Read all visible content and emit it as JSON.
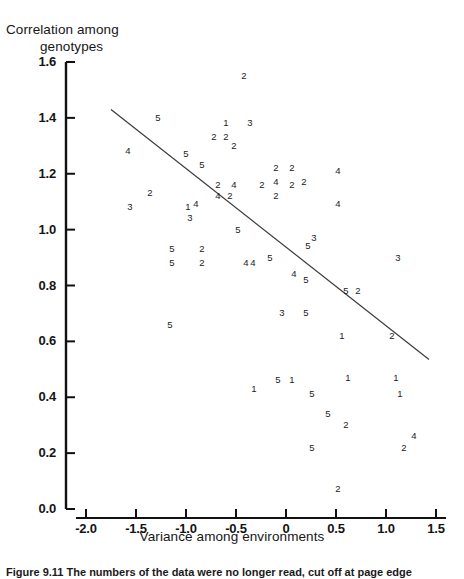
{
  "figure": {
    "y_axis_title": "Correlation among genotypes",
    "y_axis_title_line1": "Correlation among",
    "y_axis_title_line2": "genotypes",
    "x_axis_title": "Variance among environments",
    "caption": "Figure 9.11  The numbers of the data were no longer read, cut off at page edge"
  },
  "chart_data": {
    "type": "scatter",
    "title": "",
    "xlabel": "Variance among environments",
    "ylabel": "Correlation among genotypes",
    "xlim": [
      -2.0,
      1.5
    ],
    "ylim": [
      0.0,
      1.6
    ],
    "xticks": [
      "-2.0",
      "-1.5",
      "-1.0",
      "-0.5",
      "0",
      "0.5",
      "1.0",
      "1.5"
    ],
    "xtick_values": [
      -2.0,
      -1.5,
      -1.0,
      -0.5,
      0,
      0.5,
      1.0,
      1.5
    ],
    "yticks": [
      "0.0",
      "0.2",
      "0.4",
      "0.6",
      "0.8",
      "1.0",
      "1.2",
      "1.4",
      "1.6"
    ],
    "ytick_values": [
      0.0,
      0.2,
      0.4,
      0.6,
      0.8,
      1.0,
      1.2,
      1.4,
      1.6
    ],
    "grid": false,
    "legend": "none",
    "marker_style": "digit-label",
    "note": "Each plotted point is drawn as a digit character 1-5 denoting its group.",
    "trend_line": {
      "type": "linear-fit",
      "x_start": -1.75,
      "y_start": 1.43,
      "x_end": 1.43,
      "y_end": 0.535
    },
    "points": [
      {
        "x": -0.42,
        "y": 1.55,
        "label": "2"
      },
      {
        "x": -1.28,
        "y": 1.4,
        "label": "5"
      },
      {
        "x": -0.6,
        "y": 1.38,
        "label": "1"
      },
      {
        "x": -0.36,
        "y": 1.38,
        "label": "3"
      },
      {
        "x": -0.72,
        "y": 1.33,
        "label": "2"
      },
      {
        "x": -0.6,
        "y": 1.33,
        "label": "2"
      },
      {
        "x": -0.52,
        "y": 1.3,
        "label": "2"
      },
      {
        "x": -1.58,
        "y": 1.28,
        "label": "4"
      },
      {
        "x": -1.0,
        "y": 1.27,
        "label": "5"
      },
      {
        "x": -0.84,
        "y": 1.23,
        "label": "5"
      },
      {
        "x": -0.1,
        "y": 1.22,
        "label": "2"
      },
      {
        "x": 0.06,
        "y": 1.22,
        "label": "2"
      },
      {
        "x": 0.52,
        "y": 1.21,
        "label": "4"
      },
      {
        "x": -0.68,
        "y": 1.16,
        "label": "2"
      },
      {
        "x": -0.52,
        "y": 1.16,
        "label": "4"
      },
      {
        "x": -0.1,
        "y": 1.17,
        "label": "4"
      },
      {
        "x": -0.24,
        "y": 1.16,
        "label": "2"
      },
      {
        "x": 0.06,
        "y": 1.16,
        "label": "2"
      },
      {
        "x": 0.18,
        "y": 1.17,
        "label": "2"
      },
      {
        "x": -0.68,
        "y": 1.12,
        "label": "4"
      },
      {
        "x": -0.56,
        "y": 1.12,
        "label": "2"
      },
      {
        "x": -0.1,
        "y": 1.12,
        "label": "2"
      },
      {
        "x": -1.36,
        "y": 1.13,
        "label": "2"
      },
      {
        "x": 0.52,
        "y": 1.09,
        "label": "4"
      },
      {
        "x": -1.56,
        "y": 1.08,
        "label": "3"
      },
      {
        "x": -0.98,
        "y": 1.08,
        "label": "1"
      },
      {
        "x": -0.9,
        "y": 1.09,
        "label": "4"
      },
      {
        "x": -0.96,
        "y": 1.04,
        "label": "3"
      },
      {
        "x": -0.48,
        "y": 1.0,
        "label": "5"
      },
      {
        "x": 0.28,
        "y": 0.97,
        "label": "3"
      },
      {
        "x": 0.22,
        "y": 0.94,
        "label": "5"
      },
      {
        "x": 1.12,
        "y": 0.9,
        "label": "3"
      },
      {
        "x": -1.14,
        "y": 0.93,
        "label": "5"
      },
      {
        "x": -0.84,
        "y": 0.93,
        "label": "2"
      },
      {
        "x": -1.14,
        "y": 0.88,
        "label": "5"
      },
      {
        "x": -0.84,
        "y": 0.88,
        "label": "2"
      },
      {
        "x": -0.4,
        "y": 0.88,
        "label": "4"
      },
      {
        "x": -0.33,
        "y": 0.88,
        "label": "4"
      },
      {
        "x": -0.16,
        "y": 0.9,
        "label": "5"
      },
      {
        "x": 0.08,
        "y": 0.84,
        "label": "4"
      },
      {
        "x": 0.2,
        "y": 0.82,
        "label": "5"
      },
      {
        "x": 0.6,
        "y": 0.78,
        "label": "5"
      },
      {
        "x": 0.72,
        "y": 0.78,
        "label": "2"
      },
      {
        "x": -1.16,
        "y": 0.66,
        "label": "5"
      },
      {
        "x": -0.04,
        "y": 0.7,
        "label": "3"
      },
      {
        "x": 0.2,
        "y": 0.7,
        "label": "5"
      },
      {
        "x": 0.56,
        "y": 0.62,
        "label": "1"
      },
      {
        "x": 1.06,
        "y": 0.62,
        "label": "2"
      },
      {
        "x": 1.1,
        "y": 0.47,
        "label": "1"
      },
      {
        "x": -0.32,
        "y": 0.43,
        "label": "1"
      },
      {
        "x": -0.08,
        "y": 0.46,
        "label": "5"
      },
      {
        "x": 0.06,
        "y": 0.46,
        "label": "1"
      },
      {
        "x": 0.62,
        "y": 0.47,
        "label": "1"
      },
      {
        "x": 0.26,
        "y": 0.41,
        "label": "5"
      },
      {
        "x": 1.14,
        "y": 0.41,
        "label": "1"
      },
      {
        "x": 0.42,
        "y": 0.34,
        "label": "5"
      },
      {
        "x": 0.6,
        "y": 0.3,
        "label": "2"
      },
      {
        "x": 1.28,
        "y": 0.26,
        "label": "4"
      },
      {
        "x": 0.26,
        "y": 0.22,
        "label": "5"
      },
      {
        "x": 1.18,
        "y": 0.22,
        "label": "2"
      },
      {
        "x": 0.52,
        "y": 0.07,
        "label": "2"
      }
    ]
  }
}
